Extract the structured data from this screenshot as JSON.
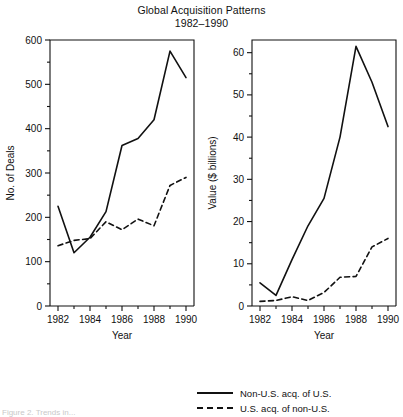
{
  "title": {
    "line1": "Global Acquisition Patterns",
    "line2": "1982–1990"
  },
  "legend": {
    "position": "bottom-right",
    "items": [
      {
        "label": "Non-U.S. acq. of U.S.",
        "style": "solid",
        "key_name": "solid-line-key"
      },
      {
        "label": "U.S. acq. of non-U.S.",
        "style": "dashed",
        "key_name": "dashed-line-key"
      }
    ]
  },
  "caption": "Figure 2. Trends in...",
  "chart_data": [
    {
      "type": "line",
      "panel": "left",
      "title": "",
      "xlabel": "Year",
      "ylabel": "No. of Deals",
      "x": [
        1982,
        1983,
        1984,
        1985,
        1986,
        1987,
        1988,
        1989,
        1990
      ],
      "xlim": [
        1981.5,
        1990.5
      ],
      "ylim": [
        0,
        600
      ],
      "yticks": [
        0,
        100,
        200,
        300,
        400,
        500,
        600
      ],
      "yminor_step": 50,
      "xticks": [
        1982,
        1983,
        1984,
        1985,
        1986,
        1987,
        1988,
        1989,
        1990
      ],
      "xtick_labels": [
        "1982",
        "",
        "1984",
        "",
        "1986",
        "",
        "1988",
        "",
        "1990"
      ],
      "grid": false,
      "series": [
        {
          "name": "Non-U.S. acq. of U.S.",
          "style": "solid",
          "values": [
            225,
            120,
            155,
            213,
            362,
            378,
            420,
            575,
            515
          ]
        },
        {
          "name": "U.S. acq. of non-U.S.",
          "style": "dashed",
          "values": [
            136,
            148,
            152,
            190,
            172,
            196,
            181,
            272,
            290
          ]
        }
      ]
    },
    {
      "type": "line",
      "panel": "right",
      "title": "",
      "xlabel": "Year",
      "ylabel": "Value ($ billions)",
      "x": [
        1982,
        1983,
        1984,
        1985,
        1986,
        1987,
        1988,
        1989,
        1990
      ],
      "xlim": [
        1981.5,
        1990.5
      ],
      "ylim": [
        0,
        63
      ],
      "yticks": [
        0,
        10,
        20,
        30,
        40,
        50,
        60
      ],
      "yminor_step": 5,
      "xticks": [
        1982,
        1983,
        1984,
        1985,
        1986,
        1987,
        1988,
        1989,
        1990
      ],
      "xtick_labels": [
        "1982",
        "",
        "1984",
        "",
        "1986",
        "",
        "1988",
        "",
        "1990"
      ],
      "grid": false,
      "series": [
        {
          "name": "Non-U.S. acq. of U.S.",
          "style": "solid",
          "values": [
            5.5,
            2.5,
            11.0,
            19.0,
            25.5,
            40.0,
            61.5,
            53.0,
            42.5
          ]
        },
        {
          "name": "U.S. acq. of non-U.S.",
          "style": "dashed",
          "values": [
            1.1,
            1.3,
            2.2,
            1.3,
            3.2,
            6.8,
            7.0,
            14.0,
            16.0
          ]
        }
      ]
    }
  ]
}
